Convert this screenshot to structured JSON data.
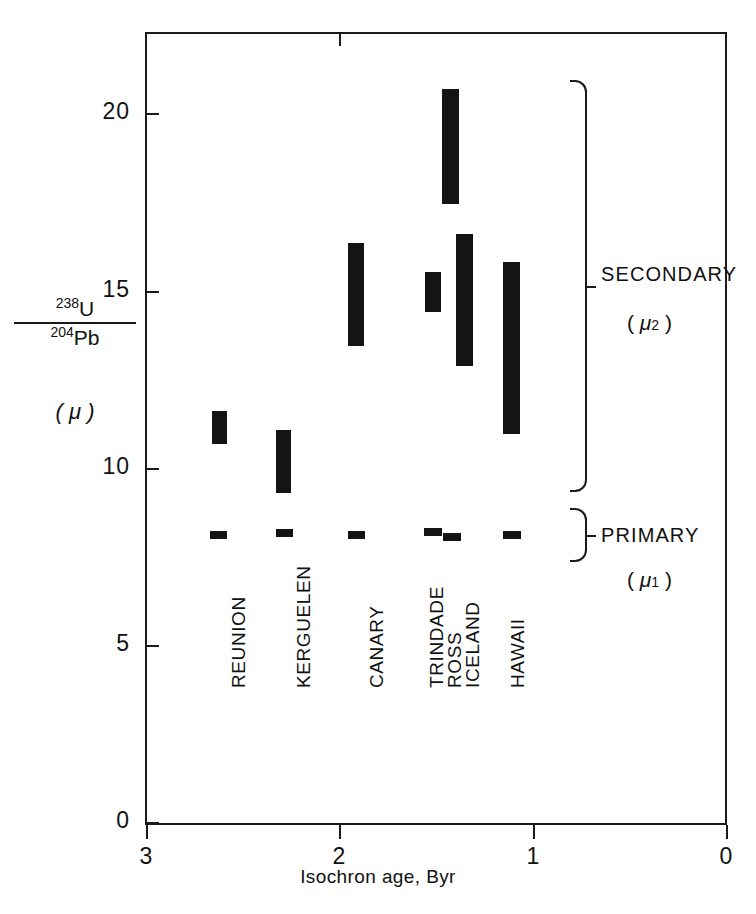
{
  "chart_data": {
    "type": "bar",
    "orientation": "vertical-range",
    "title": "",
    "xlabel": "Isochron age, Byr",
    "ylabel": "238U / 204Pb  (μ)",
    "ylabel_numerator": "238U",
    "ylabel_numerator_sup": "238",
    "ylabel_numerator_el": "U",
    "ylabel_denominator_sup": "204",
    "ylabel_denominator_el": "Pb",
    "ylabel_symbol": "( μ )",
    "xlim": [
      3,
      0
    ],
    "ylim": [
      0,
      22.4
    ],
    "x_axis_reversed": true,
    "grid": false,
    "xticks": [
      3,
      2,
      1,
      0
    ],
    "xtick_labels": [
      "3",
      "2",
      "1",
      "0"
    ],
    "yticks": [
      0,
      5,
      10,
      15,
      20
    ],
    "ytick_labels": [
      "0",
      "5",
      "10",
      "15",
      "20"
    ],
    "series": [
      {
        "name": "Secondary (μ2)",
        "group": "SECONDARY",
        "values": [
          {
            "locality": "REUNION",
            "age": 2.47,
            "mu_low": 10.5,
            "mu_high": 11.3
          },
          {
            "locality": "KERGUELEN",
            "age": 2.23,
            "mu_low": 9.2,
            "mu_high": 10.9
          },
          {
            "locality": "CANARY",
            "age": 1.83,
            "mu_low": 13.4,
            "mu_high": 16.0
          },
          {
            "locality": "TRINDADE",
            "age": 1.37,
            "mu_low": 14.3,
            "mu_high": 15.3
          },
          {
            "locality": "ROSS",
            "age": 1.26,
            "mu_low": 17.2,
            "mu_high": 20.2
          },
          {
            "locality": "ICELAND",
            "age": 1.24,
            "mu_low": 12.7,
            "mu_high": 16.3
          },
          {
            "locality": "HAWAII",
            "age": 0.95,
            "mu_low": 10.7,
            "mu_high": 15.4
          }
        ]
      },
      {
        "name": "Primary (μ1)",
        "group": "PRIMARY",
        "values": [
          {
            "locality": "REUNION",
            "age": 2.47,
            "mu_low": 7.9,
            "mu_high": 8.1
          },
          {
            "locality": "KERGUELEN",
            "age": 2.23,
            "mu_low": 7.9,
            "mu_high": 8.1
          },
          {
            "locality": "CANARY",
            "age": 1.83,
            "mu_low": 7.9,
            "mu_high": 8.1
          },
          {
            "locality": "TRINDADE",
            "age": 1.38,
            "mu_low": 8.0,
            "mu_high": 8.2
          },
          {
            "locality": "ROSS",
            "age": 1.26,
            "mu_low": 7.8,
            "mu_high": 8.0
          },
          {
            "locality": "HAWAII",
            "age": 0.95,
            "mu_low": 7.9,
            "mu_high": 8.1
          }
        ]
      }
    ],
    "category_labels": [
      "REUNION",
      "KERGUELEN",
      "CANARY",
      "TRINDADE",
      "ROSS",
      "ICELAND",
      "HAWAII"
    ],
    "annotations": [
      {
        "id": "secondary",
        "label": "SECONDARY",
        "symbol_prefix": "( ",
        "symbol": "μ",
        "symbol_sub": "2",
        "symbol_suffix": " )",
        "mu_range": [
          8.9,
          21.1
        ]
      },
      {
        "id": "primary",
        "label": "PRIMARY",
        "symbol_prefix": "( ",
        "symbol": "μ",
        "symbol_sub": "1",
        "symbol_suffix": " )",
        "mu_range": [
          7.5,
          8.6
        ]
      }
    ],
    "colors": {
      "bar": "#141414",
      "axis": "#1a1a1a",
      "background": "#ffffff"
    }
  },
  "bars_secondary": [
    {
      "label": "REUNION",
      "left": 212,
      "top": 411,
      "width": 15,
      "height": 33
    },
    {
      "label": "KERGUELEN",
      "left": 276,
      "top": 430,
      "width": 15,
      "height": 63
    },
    {
      "label": "KERGUELEN_b",
      "left": 276,
      "top": 430,
      "width": 15,
      "height": 63
    },
    {
      "label": "CANARY",
      "left": 348,
      "top": 243,
      "width": 16,
      "height": 103
    },
    {
      "label": "TRINDADE",
      "left": 425,
      "top": 272,
      "width": 16,
      "height": 40
    },
    {
      "label": "ROSS",
      "left": 442,
      "top": 89,
      "width": 17,
      "height": 115
    },
    {
      "label": "ICELAND",
      "left": 456,
      "top": 234,
      "width": 17,
      "height": 132
    },
    {
      "label": "HAWAII",
      "left": 503,
      "top": 262,
      "width": 17,
      "height": 172
    }
  ],
  "bars_primary": [
    {
      "label": "REUNION",
      "left": 210,
      "top": 531,
      "width": 17,
      "height": 8
    },
    {
      "label": "KERGUELEN",
      "left": 276,
      "top": 529,
      "width": 17,
      "height": 8
    },
    {
      "label": "CANARY",
      "left": 348,
      "top": 531,
      "width": 17,
      "height": 8
    },
    {
      "label": "TRINDADE",
      "left": 424,
      "top": 528,
      "width": 18,
      "height": 8
    },
    {
      "label": "ROSS",
      "left": 443,
      "top": 533,
      "width": 18,
      "height": 8
    },
    {
      "label": "HAWAII",
      "left": 503,
      "top": 531,
      "width": 18,
      "height": 8
    }
  ],
  "cat_label_pos": [
    {
      "label": "REUNION",
      "left": 228,
      "top": 688
    },
    {
      "label": "KERGUELEN",
      "left": 293,
      "top": 688
    },
    {
      "label": "CANARY",
      "left": 366,
      "top": 688
    },
    {
      "label": "TRINDADE",
      "left": 426,
      "top": 688
    },
    {
      "label": "ROSS",
      "left": 444,
      "top": 688
    },
    {
      "label": "ICELAND",
      "left": 462,
      "top": 688
    },
    {
      "label": "HAWAII",
      "left": 507,
      "top": 688
    }
  ],
  "ytick_pos": [
    {
      "label": "20",
      "top": 113
    },
    {
      "label": "15",
      "top": 291
    },
    {
      "label": "10",
      "top": 468
    },
    {
      "label": "5",
      "top": 645
    },
    {
      "label": "0",
      "top": 822
    }
  ],
  "xtick_pos": [
    {
      "label": "3",
      "left": 146
    },
    {
      "label": "2",
      "left": 339
    },
    {
      "label": "1",
      "left": 533
    },
    {
      "label": "0",
      "left": 726
    }
  ]
}
